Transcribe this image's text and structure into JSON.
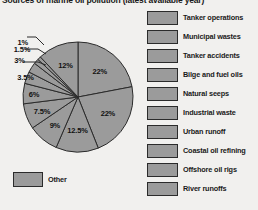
{
  "chart_title": "Sources of marine oil pollution (latest available year)",
  "colors": {
    "background": "#f1f0ee",
    "slice_fill": "#9b9b9b",
    "slice_stroke": "#2b2b2b",
    "text": "#1a1a1a"
  },
  "legend": {
    "items": [
      {
        "label": "Tanker operations"
      },
      {
        "label": "Municipal wastes"
      },
      {
        "label": "Tanker accidents"
      },
      {
        "label": "Bilge and fuel oils"
      },
      {
        "label": "Natural seeps"
      },
      {
        "label": "Industrial waste"
      },
      {
        "label": "Urban runoff"
      },
      {
        "label": "Coastal oil refining"
      },
      {
        "label": "Offshore oil rigs"
      },
      {
        "label": "River runoffs"
      }
    ],
    "other": {
      "label": "Other"
    }
  },
  "chart_data": {
    "type": "pie",
    "title": "Sources of marine oil pollution (latest available year)",
    "xlabel": "",
    "ylabel": "",
    "legend_position": "right",
    "grid": false,
    "unit": "percent",
    "total": 100,
    "labels": [
      "Tanker operations",
      "Municipal wastes",
      "Tanker accidents",
      "Bilge and fuel oils",
      "Natural seeps",
      "Industrial waste",
      "Urban runoff",
      "Coastal oil refining",
      "Offshore oil rigs",
      "River runoffs",
      "Other"
    ],
    "values": [
      22,
      22,
      12.5,
      9,
      7.5,
      6,
      3.5,
      3,
      1.5,
      1,
      12
    ],
    "data_labels": [
      "22%",
      "22%",
      "12.5%",
      "9%",
      "7.5%",
      "6%",
      "3.5%",
      "3%",
      "1.5%",
      "1%",
      "12%"
    ],
    "slices": [
      {
        "label": "Tanker operations",
        "value": 22,
        "display": "22%"
      },
      {
        "label": "Municipal wastes",
        "value": 22,
        "display": "22%"
      },
      {
        "label": "Tanker accidents",
        "value": 12.5,
        "display": "12.5%"
      },
      {
        "label": "Bilge and fuel oils",
        "value": 9,
        "display": "9%"
      },
      {
        "label": "Natural seeps",
        "value": 7.5,
        "display": "7.5%"
      },
      {
        "label": "Industrial waste",
        "value": 6,
        "display": "6%"
      },
      {
        "label": "Urban runoff",
        "value": 3.5,
        "display": "3.5%"
      },
      {
        "label": "Coastal oil refining",
        "value": 3,
        "display": "3%"
      },
      {
        "label": "Offshore oil rigs",
        "value": 1.5,
        "display": "1.5%"
      },
      {
        "label": "River runoffs",
        "value": 1,
        "display": "1%"
      },
      {
        "label": "Other",
        "value": 12,
        "display": "12%"
      }
    ]
  }
}
